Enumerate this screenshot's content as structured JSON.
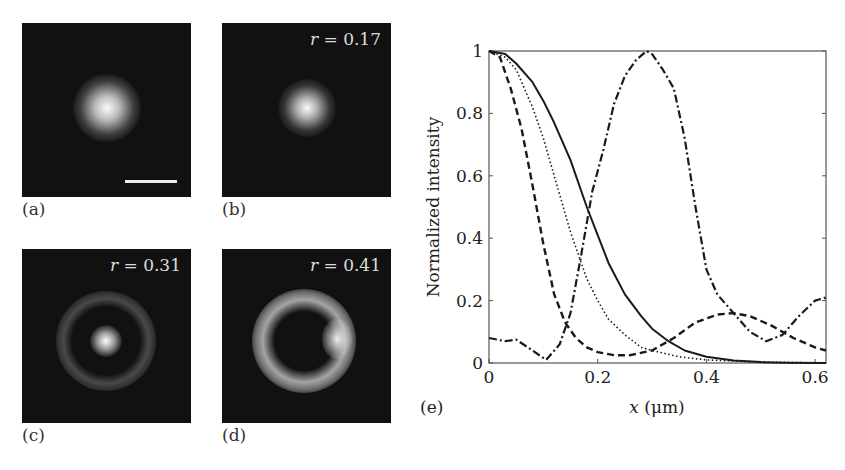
{
  "panels": [
    {
      "id": "a",
      "label": "(a)",
      "r_text": null,
      "scale_bar": true
    },
    {
      "id": "b",
      "label": "(b)",
      "r_text": "r = 0.17",
      "r_var": "r",
      "r_value": "= 0.17"
    },
    {
      "id": "c",
      "label": "(c)",
      "r_text": "r = 0.31",
      "r_var": "r",
      "r_value": "= 0.31"
    },
    {
      "id": "d",
      "label": "(d)",
      "r_text": "r = 0.41",
      "r_var": "r",
      "r_value": "= 0.41"
    }
  ],
  "plot_label": "(e)",
  "chart_data": {
    "type": "line",
    "title": "",
    "xlabel": "x (μm)",
    "ylabel": "Normalized intensity",
    "xlim": [
      0,
      0.62
    ],
    "ylim": [
      0,
      1
    ],
    "xticks": [
      "0",
      "0.2",
      "0.4",
      "0.6"
    ],
    "yticks": [
      "0",
      "0.2",
      "0.4",
      "0.6",
      "0.8",
      "1"
    ],
    "grid": false,
    "legend": null,
    "series": [
      {
        "name": "solid",
        "style": "solid",
        "x": [
          0,
          0.03,
          0.05,
          0.08,
          0.1,
          0.12,
          0.15,
          0.18,
          0.2,
          0.22,
          0.25,
          0.28,
          0.3,
          0.33,
          0.36,
          0.4,
          0.45,
          0.5,
          0.55,
          0.62
        ],
        "y": [
          1.0,
          0.99,
          0.96,
          0.9,
          0.84,
          0.77,
          0.65,
          0.5,
          0.41,
          0.32,
          0.22,
          0.15,
          0.11,
          0.07,
          0.04,
          0.02,
          0.008,
          0.003,
          0.001,
          0.0
        ]
      },
      {
        "name": "dotted",
        "style": "dotted",
        "x": [
          0,
          0.03,
          0.05,
          0.08,
          0.1,
          0.12,
          0.15,
          0.18,
          0.2,
          0.22,
          0.25,
          0.28,
          0.3,
          0.35,
          0.4,
          0.5,
          0.62
        ],
        "y": [
          1.0,
          0.98,
          0.94,
          0.82,
          0.72,
          0.6,
          0.42,
          0.27,
          0.2,
          0.14,
          0.09,
          0.05,
          0.04,
          0.02,
          0.01,
          0.003,
          0.0
        ]
      },
      {
        "name": "dashed",
        "style": "dashed",
        "x": [
          0,
          0.02,
          0.04,
          0.06,
          0.08,
          0.1,
          0.12,
          0.14,
          0.16,
          0.18,
          0.2,
          0.23,
          0.26,
          0.3,
          0.34,
          0.38,
          0.42,
          0.45,
          0.48,
          0.52,
          0.56,
          0.6,
          0.62
        ],
        "y": [
          1.0,
          0.98,
          0.88,
          0.75,
          0.57,
          0.38,
          0.22,
          0.13,
          0.08,
          0.05,
          0.035,
          0.025,
          0.025,
          0.04,
          0.08,
          0.13,
          0.155,
          0.16,
          0.15,
          0.12,
          0.08,
          0.05,
          0.04
        ]
      },
      {
        "name": "dash-dot",
        "style": "dashdot",
        "x": [
          0,
          0.03,
          0.05,
          0.08,
          0.105,
          0.13,
          0.15,
          0.17,
          0.19,
          0.21,
          0.23,
          0.25,
          0.27,
          0.29,
          0.3,
          0.32,
          0.34,
          0.36,
          0.38,
          0.4,
          0.42,
          0.45,
          0.48,
          0.51,
          0.54,
          0.57,
          0.6,
          0.62
        ],
        "y": [
          0.08,
          0.07,
          0.075,
          0.04,
          0.01,
          0.06,
          0.16,
          0.35,
          0.55,
          0.68,
          0.83,
          0.92,
          0.97,
          1.0,
          0.99,
          0.94,
          0.88,
          0.72,
          0.5,
          0.3,
          0.22,
          0.16,
          0.1,
          0.07,
          0.09,
          0.15,
          0.2,
          0.21
        ]
      }
    ]
  }
}
